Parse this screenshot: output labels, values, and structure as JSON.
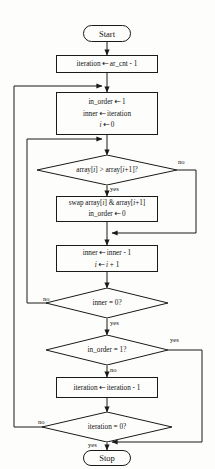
{
  "diagram": {
    "type": "flowchart",
    "stroke_color": "#1a1a1a",
    "background_color": "#fdfdfb"
  },
  "nodes": {
    "start": {
      "label": "Start",
      "shape": "terminator"
    },
    "init_iteration": {
      "shape": "process",
      "line1": "iteration ← ar_cnt - 1"
    },
    "init_pass": {
      "shape": "process",
      "line1": "in_order ← 1",
      "line2": "inner ← iteration",
      "line3": "i ← 0"
    },
    "compare": {
      "shape": "decision",
      "label": "array[i] > array[i+1]?"
    },
    "swap": {
      "shape": "process",
      "line1": "swap array[i] & array[i+1]",
      "line2": "in_order ← 0"
    },
    "advance": {
      "shape": "process",
      "line1": "inner ← inner - 1",
      "line2": "i ← i + 1"
    },
    "inner_done": {
      "shape": "decision",
      "label": "inner = 0?"
    },
    "in_order_check": {
      "shape": "decision",
      "label": "in_order = 1?"
    },
    "dec_iteration": {
      "shape": "process",
      "line1": "iteration ← iteration - 1"
    },
    "iteration_done": {
      "shape": "decision",
      "label": "iteration = 0?"
    },
    "stop": {
      "label": "Stop",
      "shape": "terminator"
    }
  },
  "edge_labels": {
    "compare_no": "no",
    "compare_yes": "yes",
    "inner_done_no": "no",
    "inner_done_yes": "yes",
    "in_order_yes": "yes",
    "in_order_no": "no",
    "iteration_done_no": "no",
    "iteration_done_yes": "yes"
  }
}
